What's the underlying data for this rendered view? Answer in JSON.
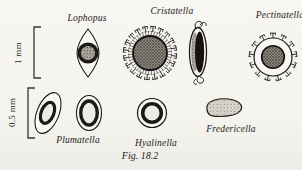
{
  "figure": {
    "caption": "Fig. 18.2"
  },
  "scale_bars": [
    {
      "label": "1 mm"
    },
    {
      "label": "0.5 mm"
    }
  ],
  "organisms": [
    {
      "name": "Lophopus"
    },
    {
      "name": "Cristatella"
    },
    {
      "name": "Pectinatella"
    },
    {
      "name": "Plumatella"
    },
    {
      "name": "Hyalinella"
    },
    {
      "name": "Fredericella"
    }
  ],
  "colors": {
    "ink": "#1c1a17",
    "paper": "#f6f5f1"
  }
}
